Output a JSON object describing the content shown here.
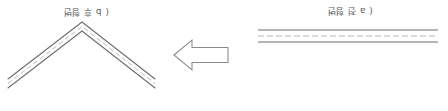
{
  "figure": {
    "title": "",
    "panels": [
      {
        "id": "panel-a",
        "label": "( a 전 형변",
        "caption_reading": "(a) before deformation",
        "content": "flat-sheet-side-view",
        "orientation": "rotated-180"
      },
      {
        "id": "panel-b",
        "label": "( b 후 형변",
        "caption_reading": "(b) after deformation",
        "content": "bent-chevron-sheet-side-view",
        "orientation": "rotated-180"
      }
    ],
    "arrow": {
      "name": "process-arrow",
      "direction": "left",
      "style": "block-outline"
    },
    "colors": {
      "background": "#ffffff",
      "stroke": "#8a8a8a",
      "stroke_dark": "#6e6e6e",
      "text": "#3a3a3a"
    },
    "geometry": {
      "flat_sheet": {
        "x1": 258,
        "x2": 438,
        "y_top": 30,
        "y_mid": 36,
        "y_bottom": 42
      },
      "chevron": {
        "apex_x": 82,
        "apex_y_outer": 22,
        "apex_y_inner": 30,
        "left_x": 8,
        "right_x": 155,
        "end_y": 88
      },
      "arrow_box": {
        "x": 174,
        "y": 40,
        "w": 54,
        "h": 30
      }
    }
  }
}
